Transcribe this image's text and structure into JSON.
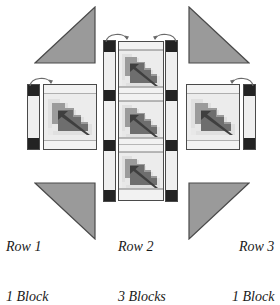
{
  "diagram": {
    "background_color": "#ffffff"
  },
  "palette": {
    "triangle_fill": "#9a9a9a",
    "triangle_stroke": "#4a4a4a",
    "cornerstone": "#232323",
    "sashing_fill": "#efefef",
    "block_background": "#ececec",
    "block_light": "#e3e3e3",
    "block_mid": "#9b9b9b",
    "block_dark": "#6e6e6e",
    "block_stripe": "#3f3f3f",
    "outline": "#4a4a4a",
    "arrow_stroke": "#6a6a6a",
    "label_color": "#1a1a1a"
  },
  "rows": [
    {
      "id": "row-1",
      "name": "Row 1",
      "count_label": "1 Block",
      "blocks": 1,
      "sashing_position": "left",
      "arrows": 1
    },
    {
      "id": "row-2",
      "name": "Row 2",
      "count_label": "3 Blocks",
      "blocks": 3,
      "sashing_position": "both",
      "arrows": 2
    },
    {
      "id": "row-3",
      "name": "Row 3",
      "count_label": "1 Block",
      "blocks": 1,
      "sashing_position": "right",
      "arrows": 1
    }
  ],
  "setting_triangles": [
    {
      "id": "triangle-top-left",
      "corner": "top-left",
      "right_angle": "bottom-right"
    },
    {
      "id": "triangle-top-right",
      "corner": "top-right",
      "right_angle": "bottom-left"
    },
    {
      "id": "triangle-bottom-left",
      "corner": "bottom-left",
      "right_angle": "top-right"
    },
    {
      "id": "triangle-bottom-right",
      "corner": "bottom-right",
      "right_angle": "top-left"
    }
  ],
  "block_motif": {
    "name": "stepped-arrow-block",
    "description": "Pixelated stepped arrow motif with diagonal stripe"
  }
}
